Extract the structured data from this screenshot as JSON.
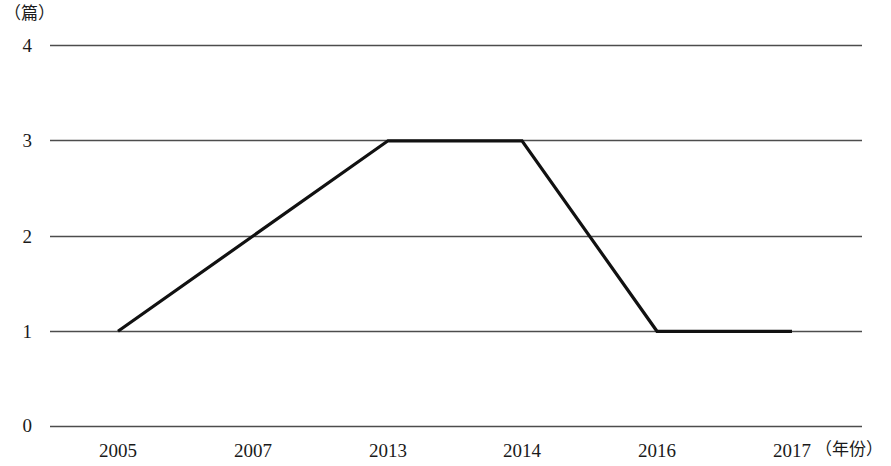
{
  "chart_data": {
    "type": "line",
    "title": "",
    "xlabel": "（年份）",
    "ylabel": "（篇）",
    "x": [
      "2005",
      "2007",
      "2013",
      "2014",
      "2016",
      "2017"
    ],
    "categories": [
      "2005",
      "2007",
      "2013",
      "2014",
      "2016",
      "2017"
    ],
    "values": [
      1,
      2,
      3,
      3,
      1,
      1
    ],
    "series": [
      {
        "name": "",
        "values": [
          1,
          2,
          3,
          3,
          1,
          1
        ]
      }
    ],
    "ylim": [
      0,
      4
    ],
    "yticks": [
      "0",
      "1",
      "2",
      "3",
      "4"
    ],
    "ytick_values": [
      0,
      1,
      2,
      3,
      4
    ],
    "grid": true,
    "legend": "none",
    "line_color": "#111111",
    "grid_color": "#555555"
  },
  "axes": {
    "y_unit": "（篇）",
    "x_unit": "（年份）",
    "y_ticks": [
      {
        "label": "4",
        "value": 4
      },
      {
        "label": "3",
        "value": 3
      },
      {
        "label": "2",
        "value": 2
      },
      {
        "label": "1",
        "value": 1
      },
      {
        "label": "0",
        "value": 0
      }
    ],
    "x_ticks": [
      {
        "label": "2005",
        "value": 1
      },
      {
        "label": "2007",
        "value": 2
      },
      {
        "label": "2013",
        "value": 3
      },
      {
        "label": "2014",
        "value": 3
      },
      {
        "label": "2016",
        "value": 1
      },
      {
        "label": "2017",
        "value": 1
      }
    ]
  }
}
